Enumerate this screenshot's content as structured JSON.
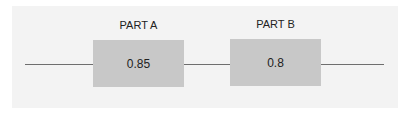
{
  "diagram": {
    "type": "series-reliability-block-diagram",
    "blocks": [
      {
        "label": "PART A",
        "value": "0.85"
      },
      {
        "label": "PART B",
        "value": "0.8"
      }
    ],
    "colors": {
      "background": "#f3f3f3",
      "block_fill": "#c8c8c8",
      "line": "#6e6e6e"
    }
  }
}
